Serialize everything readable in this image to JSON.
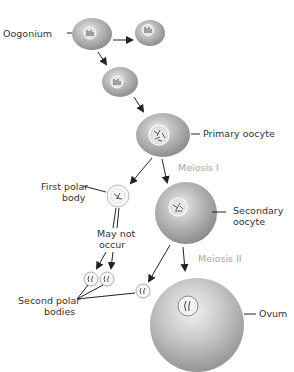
{
  "diagram": {
    "labels": {
      "oogonium": "Oogonium",
      "primary_oocyte": "Primary oocyte",
      "meiosis_1": "Meiosis I",
      "first_polar_line1": "First polar",
      "first_polar_line2": "body",
      "secondary_line1": "Secondary",
      "secondary_line2": "oocyte",
      "may_not_line1": "May not",
      "may_not_line2": "occur",
      "meiosis_2": "Meiosis II",
      "second_polar_line1": "Second polar",
      "second_polar_line2": "bodies",
      "ovum": "Ovum"
    },
    "colors": {
      "cell_light": "#e6e6e6",
      "cell_dark": "#8c8c8c",
      "text": "#333333",
      "meiosis_text": "#a8a8a8",
      "arrow": "#222222"
    }
  }
}
